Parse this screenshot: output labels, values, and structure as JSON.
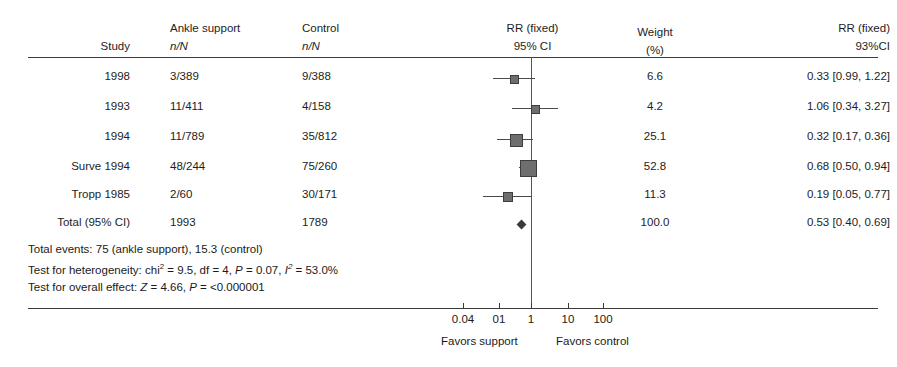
{
  "chart_data": {
    "type": "forest",
    "title": "",
    "columns": {
      "study": "Study",
      "treatment_group": "Ankle support",
      "treatment_units": "n/N",
      "control_group": "Control",
      "control_units": "n/N",
      "plot_header": "RR (fixed)",
      "plot_ci": "95% CI",
      "weight_header": "Weight",
      "weight_units": "(%)",
      "effect_header": "RR (fixed)",
      "effect_ci": "93%CI"
    },
    "rows": [
      {
        "study": "1998",
        "treatment": "3/389",
        "control": "9/388",
        "weight": "6.6",
        "effect_text": "0.33 [0.99, 1.22]",
        "estimate": 0.33,
        "ci_low": 0.99,
        "ci_high": 1.22,
        "marker_x": 513,
        "line_left": 493,
        "line_right": 535,
        "box_size": 7
      },
      {
        "study": "1993",
        "treatment": "11/411",
        "control": "4/158",
        "weight": "4.2",
        "effect_text": "1.06 [0.34, 3.27]",
        "estimate": 1.06,
        "ci_low": 0.34,
        "ci_high": 3.27,
        "marker_x": 534,
        "line_left": 512,
        "line_right": 558,
        "box_size": 7
      },
      {
        "study": "1994",
        "treatment": "11/789",
        "control": "35/812",
        "weight": "25.1",
        "effect_text": "0.32 [0.17, 0.36]",
        "estimate": 0.32,
        "ci_low": 0.17,
        "ci_high": 0.36,
        "marker_x": 515,
        "line_left": 497,
        "line_right": 533,
        "box_size": 11
      },
      {
        "study": "Surve 1994",
        "treatment": "48/244",
        "control": "75/260",
        "weight": "52.8",
        "effect_text": "0.68 [0.50, 0.94]",
        "estimate": 0.68,
        "ci_low": 0.5,
        "ci_high": 0.94,
        "marker_x": 527,
        "line_left": 519,
        "line_right": 535,
        "box_size": 15
      },
      {
        "study": "Tropp 1985",
        "treatment": "2/60",
        "control": "30/171",
        "weight": "11.3",
        "effect_text": "0.19 [0.05, 0.77]",
        "estimate": 0.19,
        "ci_low": 0.05,
        "ci_high": 0.77,
        "marker_x": 507,
        "line_left": 483,
        "line_right": 532,
        "box_size": 8
      }
    ],
    "total_row": {
      "study": "Total (95% CI)",
      "treatment": "1993",
      "control": "1789",
      "weight": "100.0",
      "effect_text": "0.53 [0.40, 0.69]",
      "estimate": 0.53,
      "ci_low": 0.4,
      "ci_high": 0.69,
      "marker_x": 521,
      "diamond_size": 7
    },
    "footnotes": {
      "total_events": "Total events: 75 (ankle support), 15.3 (control)",
      "heterogeneity_prefix": "Test for heterogeneity: chi",
      "heterogeneity_sup1": "2",
      "heterogeneity_mid": " = 9.5, df = 4, ",
      "heterogeneity_p_italic": "P",
      "heterogeneity_p_rest": " = 0.07, ",
      "heterogeneity_i_italic": "I",
      "heterogeneity_sup2": "2",
      "heterogeneity_end": " = 53.0%",
      "overall_prefix": "Test for overall effect: ",
      "overall_z_italic": "Z",
      "overall_z_rest": " = 4.66, ",
      "overall_p_italic": "P",
      "overall_p_rest": " = <0.000001"
    },
    "axis": {
      "scale": "log",
      "tick_labels": [
        "0.04",
        "01",
        "1",
        "10",
        "100"
      ],
      "tick_positions_px": [
        463,
        499,
        531,
        568,
        603
      ],
      "null_value": 1,
      "null_line_px": 531,
      "favors_left": "Favors support",
      "favors_right": "Favors control"
    },
    "colors": {
      "text": "#1d1d1d",
      "rule": "#3b3b3b",
      "marker": "#6e6e6e",
      "marker_border": "#3d3d3d",
      "ci_line": "#4a4a4a",
      "null_line": "#555555",
      "background": "#ffffff"
    }
  }
}
